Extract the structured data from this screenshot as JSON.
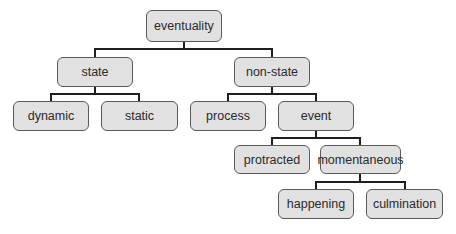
{
  "diagram": {
    "type": "tree",
    "root": "eventuality",
    "nodes": [
      {
        "id": "eventuality",
        "label": "eventuality",
        "x": 146,
        "y": 10,
        "w": 76,
        "h": 32
      },
      {
        "id": "state",
        "label": "state",
        "x": 57,
        "y": 57,
        "w": 76,
        "h": 30
      },
      {
        "id": "non_state",
        "label": "non-state",
        "x": 234,
        "y": 57,
        "w": 76,
        "h": 30
      },
      {
        "id": "dynamic",
        "label": "dynamic",
        "x": 13,
        "y": 101,
        "w": 76,
        "h": 30
      },
      {
        "id": "static",
        "label": "static",
        "x": 101,
        "y": 101,
        "w": 77,
        "h": 30
      },
      {
        "id": "process",
        "label": "process",
        "x": 190,
        "y": 101,
        "w": 76,
        "h": 30
      },
      {
        "id": "event",
        "label": "event",
        "x": 278,
        "y": 101,
        "w": 76,
        "h": 30
      },
      {
        "id": "protracted",
        "label": "protracted",
        "x": 234,
        "y": 145,
        "w": 76,
        "h": 29
      },
      {
        "id": "momentaneous",
        "label": "momentaneous",
        "x": 320,
        "y": 145,
        "w": 81,
        "h": 29
      },
      {
        "id": "happening",
        "label": "happening",
        "x": 278,
        "y": 189,
        "w": 76,
        "h": 30
      },
      {
        "id": "culmination",
        "label": "culmination",
        "x": 366,
        "y": 189,
        "w": 77,
        "h": 30
      }
    ],
    "edges": [
      {
        "from": "eventuality",
        "to": "state"
      },
      {
        "from": "eventuality",
        "to": "non_state"
      },
      {
        "from": "state",
        "to": "dynamic"
      },
      {
        "from": "state",
        "to": "static"
      },
      {
        "from": "non_state",
        "to": "process"
      },
      {
        "from": "non_state",
        "to": "event"
      },
      {
        "from": "event",
        "to": "protracted"
      },
      {
        "from": "event",
        "to": "momentaneous"
      },
      {
        "from": "momentaneous",
        "to": "happening"
      },
      {
        "from": "momentaneous",
        "to": "culmination"
      }
    ],
    "colors": {
      "node_fill": "#e1e1e1",
      "node_border": "#5a5a5a",
      "edge": "#1e1e1e",
      "text": "#2a2a2a"
    }
  },
  "labels": {
    "eventuality": "eventuality",
    "state": "state",
    "non_state": "non-state",
    "dynamic": "dynamic",
    "static": "static",
    "process": "process",
    "event": "event",
    "protracted": "protracted",
    "momentaneous": "momentaneous",
    "happening": "happening",
    "culmination": "culmination"
  }
}
